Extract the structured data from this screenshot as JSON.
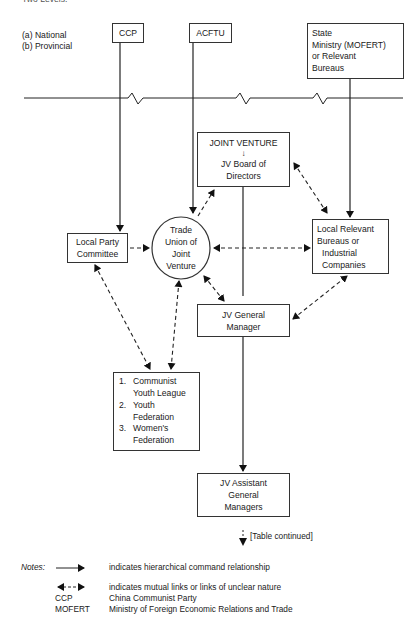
{
  "header": {
    "cut_text": "Two Levels:"
  },
  "levels": {
    "a": "(a) National",
    "b": "(b) Provincial"
  },
  "boxes": {
    "ccp": "CCP",
    "acftu": "ACFTU",
    "state_ministry": [
      "State",
      "Ministry (MOFERT)",
      "or Relevant",
      "Bureaus"
    ],
    "joint_venture": {
      "title": "JOINT  VENTURE",
      "arrow": "↓",
      "lines": [
        "JV Board of",
        "Directors"
      ]
    },
    "local_party": [
      "Local Party",
      "Committee"
    ],
    "trade_union": [
      "Trade",
      "Union of",
      "Joint",
      "Venture"
    ],
    "local_relevant": [
      "Local Relevant",
      "Bureaus or",
      "Industrial",
      "Companies"
    ],
    "general_manager": [
      "JV General",
      "Manager"
    ],
    "orgs": [
      {
        "num": "1.",
        "lines": [
          "Communist",
          "Youth League"
        ]
      },
      {
        "num": "2.",
        "lines": [
          "Youth",
          "Federation"
        ]
      },
      {
        "num": "3.",
        "lines": [
          "Women's",
          "Federation"
        ]
      }
    ],
    "assistant_gm": [
      "JV Assistant",
      "General",
      "Managers"
    ]
  },
  "continued": "[Table continued]",
  "notes": {
    "label": "Notes:",
    "items": [
      {
        "key": "solid-arrow",
        "text": "indicates hierarchical command relationship"
      },
      {
        "key": "dashed-double-arrow",
        "text": "indicates mutual links or links of unclear nature"
      },
      {
        "key": "CCP",
        "text": "China Communist Party"
      },
      {
        "key": "MOFERT",
        "text": "Ministry of Foreign Economic Relations and Trade"
      }
    ]
  }
}
